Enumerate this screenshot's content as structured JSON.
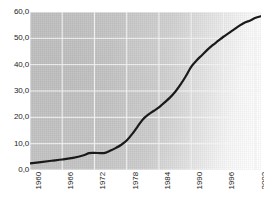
{
  "chart_data": {
    "type": "line",
    "title": "",
    "subtitle": "",
    "xlabel": "",
    "ylabel": "",
    "xlim": [
      1960,
      2003
    ],
    "ylim": [
      0,
      60
    ],
    "grid": true,
    "legend": false,
    "legend_position": "none",
    "y_ticks": [
      "0,0",
      "10,0",
      "20,0",
      "30,0",
      "40,0",
      "50,0",
      "60,0"
    ],
    "y_tick_values": [
      0,
      10,
      20,
      30,
      40,
      50,
      60
    ],
    "x_ticks": [
      "1960",
      "1966",
      "1972",
      "1978",
      "1984",
      "1990",
      "1996",
      "2002"
    ],
    "x_tick_values": [
      1960,
      1966,
      1972,
      1978,
      1984,
      1990,
      1996,
      2002
    ],
    "x_tick_rotation": -90,
    "decimal_separator": ",",
    "series": [
      {
        "name": "value",
        "color": "#1a1a1a",
        "line_width": 2.2,
        "x": [
          1960,
          1962,
          1964,
          1966,
          1968,
          1970,
          1971,
          1972,
          1973,
          1974,
          1975,
          1976,
          1977,
          1978,
          1979,
          1980,
          1981,
          1982,
          1983,
          1984,
          1985,
          1986,
          1987,
          1988,
          1989,
          1990,
          1991,
          1992,
          1993,
          1994,
          1995,
          1996,
          1997,
          1998,
          1999,
          2000,
          2001,
          2002,
          2003
        ],
        "values": [
          2.5,
          3.0,
          3.5,
          4.0,
          4.6,
          5.6,
          6.4,
          6.5,
          6.4,
          6.5,
          7.4,
          8.4,
          9.6,
          11.2,
          13.6,
          16.4,
          19.2,
          21.0,
          22.4,
          23.8,
          25.6,
          27.4,
          29.6,
          32.4,
          35.6,
          39.2,
          41.6,
          43.6,
          45.6,
          47.4,
          49.0,
          50.6,
          52.0,
          53.4,
          54.8,
          56.0,
          56.8,
          57.8,
          58.4
        ]
      }
    ],
    "colors": {
      "line": "#1a1a1a",
      "grid": "#f2f2f2",
      "plot_background": "#c4c4c4",
      "page_background": "#ffffff",
      "tick_text": "#1d1d1d"
    }
  }
}
